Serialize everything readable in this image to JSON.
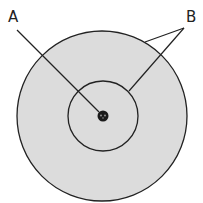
{
  "diagram": {
    "type": "atom-model",
    "labels": {
      "a": "A",
      "b": "B"
    },
    "colors": {
      "shell_fill": "#dcdcdc",
      "stroke": "#222222",
      "nucleus": "#1a1a1a",
      "background": "#ffffff"
    },
    "parts": {
      "nucleus": "nucleus",
      "inner_shell": "inner orbit",
      "outer_shell": "outer orbit"
    }
  }
}
